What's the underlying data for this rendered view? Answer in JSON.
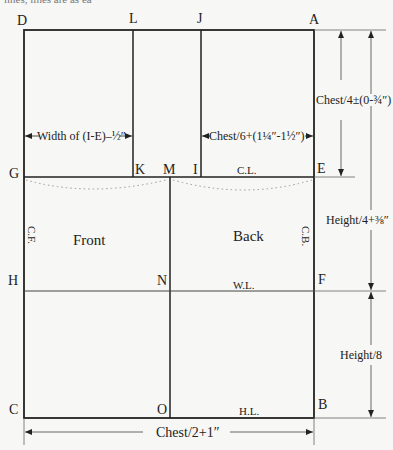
{
  "top_cut_text": "lines, lines are as ea",
  "points": {
    "D": "D",
    "L": "L",
    "J": "J",
    "A": "A",
    "G": "G",
    "K": "K",
    "M": "M",
    "I": "I",
    "E": "E",
    "H": "H",
    "N": "N",
    "F": "F",
    "C": "C",
    "O": "O",
    "B": "B"
  },
  "line_labels": {
    "chest_line": "C.L.",
    "waist_line": "W.L.",
    "hip_line": "H.L.",
    "center_front": "C.F.",
    "center_back": "C.B."
  },
  "panels": {
    "front": "Front",
    "back": "Back"
  },
  "measurements": {
    "front_width": "Width of (I-E)–½″",
    "back_width": "Chest/6+(1¼″-1½″)",
    "chest_depth": "Chest/4±(0-¾″)",
    "waist_depth": "Height/4+⅜″",
    "hip_depth": "Height/8",
    "total_width": "Chest/2+1″"
  }
}
